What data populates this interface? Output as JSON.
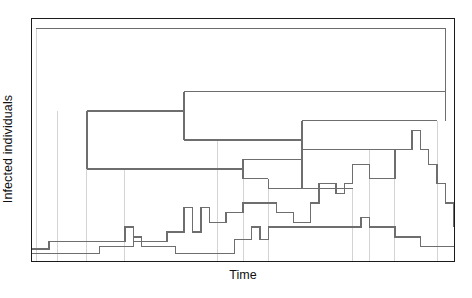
{
  "figure": {
    "type": "phylodynamic-tree-over-prevalence",
    "xlabel": "Time",
    "ylabel": "Infected individuals"
  },
  "colors": {
    "frame": "#1a1a1a",
    "tree_line": "#6e6e6e",
    "tree_connector": "#c9c9c9",
    "curve": "#6e6e6e",
    "background": "#ffffff",
    "text": "#111111"
  },
  "chart_data": {
    "type": "line",
    "title": "",
    "xlabel": "Time",
    "ylabel": "Infected individuals",
    "xlim": [
      0,
      100
    ],
    "ylim": [
      0,
      100
    ],
    "grid": false,
    "legend": "none",
    "axis_ticks": {
      "x": [],
      "y": []
    },
    "series": [
      {
        "name": "Prevalence curve (upper, stepped)",
        "style": "step-post",
        "x": [
          0,
          2,
          4,
          6,
          8,
          10,
          12,
          14,
          16,
          18,
          20,
          22,
          24,
          26,
          28,
          30,
          32,
          34,
          36,
          38,
          40,
          42,
          44,
          46,
          48,
          50,
          52,
          54,
          56,
          58,
          60,
          62,
          64,
          66,
          68,
          70,
          72,
          74,
          76,
          78,
          80,
          82,
          84,
          86,
          88,
          90,
          92,
          94,
          96,
          98,
          100
        ],
        "y": [
          5,
          5,
          8,
          8,
          8,
          8,
          8,
          8,
          8,
          8,
          8,
          14,
          8,
          8,
          8,
          8,
          12,
          12,
          22,
          12,
          22,
          16,
          16,
          20,
          20,
          24,
          24,
          24,
          24,
          20,
          20,
          16,
          16,
          24,
          32,
          32,
          28,
          32,
          40,
          40,
          34,
          34,
          34,
          46,
          46,
          54,
          46,
          40,
          32,
          24,
          14
        ]
      },
      {
        "name": "Prevalence curve (lower, stepped)",
        "style": "step-post",
        "x": [
          0,
          2,
          4,
          6,
          8,
          10,
          12,
          14,
          16,
          18,
          20,
          22,
          24,
          26,
          28,
          30,
          32,
          34,
          36,
          38,
          40,
          42,
          44,
          46,
          48,
          50,
          52,
          54,
          56,
          58,
          60,
          62,
          64,
          66,
          68,
          70,
          72,
          74,
          76,
          78,
          80,
          82,
          84,
          86,
          88,
          90,
          92,
          94,
          96,
          98,
          100
        ],
        "y": [
          3,
          3,
          3,
          3,
          3,
          3,
          3,
          3,
          6,
          6,
          6,
          6,
          10,
          6,
          6,
          6,
          6,
          3,
          3,
          3,
          3,
          3,
          3,
          3,
          9,
          9,
          14,
          9,
          14,
          14,
          14,
          14,
          14,
          14,
          14,
          14,
          14,
          14,
          14,
          18,
          14,
          14,
          14,
          10,
          10,
          10,
          6,
          6,
          6,
          6,
          6
        ]
      }
    ],
    "tree": {
      "description": "Transmission / phylogenetic tree drawn as nested rectangular brackets above the prevalence curves; horizontal bars are lineages, thin vertical lines drop to sampling times on the epidemic curve.",
      "node_count": 14,
      "branches": [
        {
          "id": "root",
          "y": 96,
          "x_start": 1,
          "x_end": 98
        },
        {
          "id": "n1",
          "y": 70,
          "x_start": 36,
          "x_end": 98
        },
        {
          "id": "n2",
          "y": 62,
          "x_start": 13,
          "x_end": 36
        },
        {
          "id": "n3",
          "y": 58,
          "x_start": 64,
          "x_end": 96
        },
        {
          "id": "n4",
          "y": 50,
          "x_start": 36,
          "x_end": 64
        },
        {
          "id": "n5",
          "y": 46,
          "x_start": 64,
          "x_end": 86
        },
        {
          "id": "n6",
          "y": 42,
          "x_start": 50,
          "x_end": 64
        },
        {
          "id": "n7",
          "y": 38,
          "x_start": 13,
          "x_end": 50
        },
        {
          "id": "n8",
          "y": 34,
          "x_start": 50,
          "x_end": 56
        },
        {
          "id": "n9",
          "y": 30,
          "x_start": 56,
          "x_end": 76
        },
        {
          "id": "tip1",
          "y": 0,
          "x_start": 6,
          "x_end": 6
        },
        {
          "id": "tip2",
          "y": 0,
          "x_start": 22,
          "x_end": 22
        },
        {
          "id": "tip3",
          "y": 0,
          "x_start": 44,
          "x_end": 44
        },
        {
          "id": "tip4",
          "y": 0,
          "x_start": 80,
          "x_end": 80
        }
      ]
    }
  }
}
